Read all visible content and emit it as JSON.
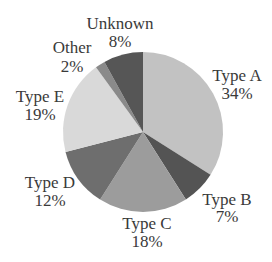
{
  "chart_data": {
    "type": "pie",
    "title": "",
    "start_angle_deg": 0,
    "direction": "clockwise",
    "categories": [
      "Type A",
      "Type B",
      "Type C",
      "Type D",
      "Type E",
      "Other",
      "Unknown"
    ],
    "values": [
      34,
      7,
      18,
      12,
      19,
      2,
      8
    ],
    "value_labels": [
      "34%",
      "7%",
      "18%",
      "12%",
      "19%",
      "2%",
      "8%"
    ],
    "colors": [
      "#c2c2c2",
      "#545454",
      "#9c9c9c",
      "#6e6e6e",
      "#d9d9d9",
      "#8a8a8a",
      "#565656"
    ],
    "legend": "none (labels placed outside slices)",
    "label_positions": [
      {
        "x": 237,
        "y1": 81,
        "y2": 99
      },
      {
        "x": 227,
        "y1": 205,
        "y2": 222
      },
      {
        "x": 147,
        "y1": 229,
        "y2": 247
      },
      {
        "x": 50,
        "y1": 188,
        "y2": 206
      },
      {
        "x": 40,
        "y1": 102,
        "y2": 120
      },
      {
        "x": 72,
        "y1": 53,
        "y2": 72
      },
      {
        "x": 120,
        "y1": 29,
        "y2": 47
      }
    ]
  },
  "layout": {
    "cx": 143,
    "cy": 132,
    "r": 80
  }
}
